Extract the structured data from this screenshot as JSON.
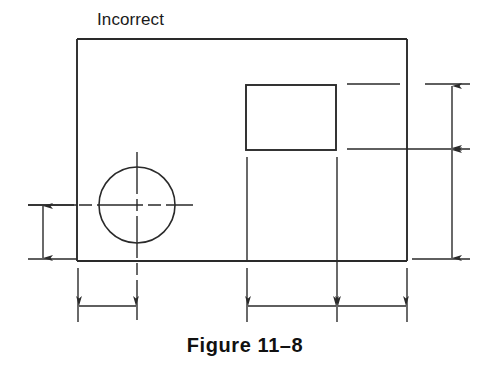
{
  "figure": {
    "label": "Incorrect",
    "caption": "Figure 11–8",
    "caption_number": "11-8",
    "type": "engineering-drawing",
    "colors": {
      "line": "#2a2a2a",
      "text": "#111111",
      "background": "#ffffff"
    }
  },
  "geometry": {
    "outer_rectangle": {
      "x": 77,
      "y": 39,
      "width": 330,
      "height": 222
    },
    "inner_rectangle": {
      "x": 246,
      "y": 85,
      "width": 90,
      "height": 65
    },
    "circle": {
      "cx": 137,
      "cy": 205,
      "r": 38
    },
    "centerlines": {
      "horizontal": {
        "x1": 28,
        "y1": 205,
        "x2": 193,
        "y2": 205
      },
      "vertical": {
        "x1": 137,
        "y1": 152,
        "x2": 137,
        "y2": 320
      }
    }
  },
  "dimensions": [
    {
      "name": "left-vertical-dimension",
      "orientation": "vertical",
      "line_x": 43,
      "from_y": 205,
      "to_y": 259,
      "arrows": "both",
      "value": ""
    },
    {
      "name": "right-upper-vertical-dimension",
      "orientation": "vertical",
      "line_x": 452,
      "from_y": 85,
      "to_y": 149,
      "arrows": "both",
      "value": ""
    },
    {
      "name": "right-lower-vertical-dimension",
      "orientation": "vertical",
      "line_x": 452,
      "from_y": 149,
      "to_y": 259,
      "arrows": "both",
      "value": ""
    },
    {
      "name": "bottom-left-horizontal-dimension",
      "orientation": "horizontal",
      "line_y": 306,
      "from_x": 78,
      "to_x": 137,
      "arrows": "both",
      "value": ""
    },
    {
      "name": "bottom-middle-horizontal-dimension",
      "orientation": "horizontal",
      "line_y": 306,
      "from_x": 247,
      "to_x": 337,
      "arrows": "both",
      "value": ""
    },
    {
      "name": "bottom-right-horizontal-dimension",
      "orientation": "horizontal",
      "line_y": 306,
      "from_x": 337,
      "to_x": 407,
      "arrows": "both",
      "value": ""
    }
  ]
}
